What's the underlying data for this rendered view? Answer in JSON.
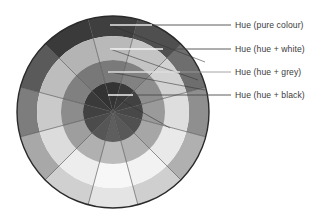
{
  "figure": {
    "name": "colour-wheel-diagram",
    "background": "#ffffff",
    "wheel": {
      "center_x": 113,
      "center_y": 112,
      "outer_radius": 96,
      "ring_radii": [
        96,
        76,
        52,
        30
      ],
      "sector_count": 12,
      "start_angle_deg": -105,
      "outline_color": "#2a2a2a",
      "divider_color": "#4a4a4a"
    },
    "rings": [
      {
        "id": "ring-pure",
        "name": "Hue (pure colour)",
        "r_outer": 96,
        "r_inner": 76,
        "values": [
          "#3f3f3f",
          "#4f4f4f",
          "#6e6e6e",
          "#8f8f8f",
          "#b0b0b0",
          "#cfcfcf",
          "#e4e4e4",
          "#d0d0d0",
          "#a8a8a8",
          "#7d7d7d",
          "#5a5a5a",
          "#3a3a3a"
        ]
      },
      {
        "id": "ring-white",
        "name": "Hue (hue + white)",
        "r_outer": 76,
        "r_inner": 52,
        "values": [
          "#b9b9b9",
          "#c4c4c4",
          "#d2d2d2",
          "#dedede",
          "#e9e9e9",
          "#f2f2f2",
          "#f7f7f7",
          "#ededed",
          "#dcdcdc",
          "#cacaca",
          "#bdbdbd",
          "#b4b4b4"
        ]
      },
      {
        "id": "ring-grey",
        "name": "Hue (hue + grey)",
        "r_outer": 52,
        "r_inner": 30,
        "values": [
          "#7a7a7a",
          "#828282",
          "#8e8e8e",
          "#9a9a9a",
          "#a6a6a6",
          "#b2b2b2",
          "#bcbcbc",
          "#b0b0b0",
          "#9e9e9e",
          "#8c8c8c",
          "#808080",
          "#787878"
        ]
      },
      {
        "id": "ring-black",
        "name": "Hue (hue + black)",
        "r_outer": 30,
        "r_inner": 0,
        "values": [
          "#343434",
          "#3a3a3a",
          "#414141",
          "#484848",
          "#505050",
          "#585858",
          "#5e5e5e",
          "#565656",
          "#4b4b4b",
          "#414141",
          "#3a3a3a",
          "#333333"
        ]
      }
    ],
    "callouts": [
      {
        "id": "callout-pure-colour",
        "label": "Hue (pure colour)",
        "text_x": 235,
        "text_y": 20,
        "line_y": 25,
        "line_start_x": 110,
        "line_end_x": 231,
        "inner_seg_end_x": 152,
        "inner_color": "#e8e8e8",
        "outer_color": "#4a4a4a"
      },
      {
        "id": "callout-hue-white",
        "label": "Hue (hue + white)",
        "text_x": 235,
        "text_y": 44,
        "line_y": 49,
        "line_start_x": 110,
        "line_end_x": 231,
        "inner_seg_end_x": 163,
        "inner_color": "#f4f4f4",
        "outer_color": "#4a4a4a"
      },
      {
        "id": "callout-hue-grey",
        "label": "Hue (hue + grey)",
        "text_x": 235,
        "text_y": 67,
        "line_y": 72,
        "line_start_x": 108,
        "line_end_x": 231,
        "inner_seg_end_x": 180,
        "inner_color": "#dcdcdc",
        "outer_color": "#9a9a9a"
      },
      {
        "id": "callout-hue-black",
        "label": "Hue (hue + black)",
        "text_x": 235,
        "text_y": 90,
        "line_y": 95,
        "line_start_x": 108,
        "line_end_x": 231,
        "inner_seg_end_x": 133,
        "inner_color": "#efefef",
        "outer_color": "#4a4a4a"
      }
    ],
    "leader_hooks": [
      {
        "id": "hook-pure",
        "from_x": 110,
        "from_y": 25,
        "to_x": 205,
        "to_y": 62
      },
      {
        "id": "hook-white",
        "from_x": 110,
        "from_y": 49,
        "to_x": 198,
        "to_y": 80
      },
      {
        "id": "hook-grey",
        "from_x": 110,
        "from_y": 72,
        "to_x": 205,
        "to_y": 90
      },
      {
        "id": "hook-black",
        "from_x": 112,
        "from_y": 95,
        "to_x": 170,
        "to_y": 128
      }
    ]
  }
}
